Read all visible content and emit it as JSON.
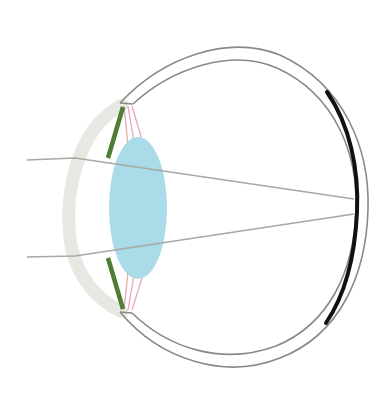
{
  "diagram": {
    "colors": {
      "background": "#ffffff",
      "sclera_outline": "#8a8a85",
      "retina": "#111111",
      "cornea": "#e6e8e2",
      "iris": "#4f7d35",
      "lens": "#a9dbe8",
      "ciliary_fibers": "#e8a8b4",
      "light_ray": "#a8a8a0"
    },
    "parts": [
      "sclera",
      "retina",
      "cornea",
      "iris",
      "lens",
      "ciliary-zonules",
      "light-rays"
    ]
  }
}
